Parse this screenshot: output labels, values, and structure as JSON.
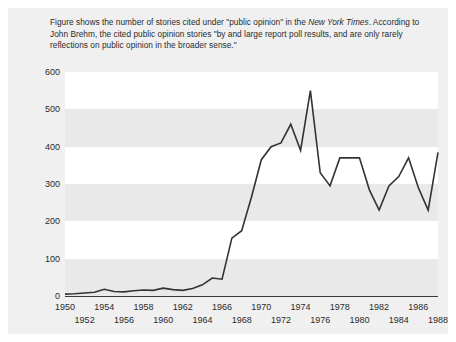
{
  "caption": {
    "line1_a": "Figure shows the number of stories cited under \"public opinion\" in the ",
    "line1_em": "New York Times",
    "line1_b": ".",
    "line2": "According to John Brehm, the cited public opinion stories \"by and large report poll results,",
    "line3": "and are only rarely reflections on public opinion in the broader sense.\""
  },
  "colors": {
    "panel_bg": "#f0f0f0",
    "band_white": "#ffffff",
    "band_gray": "#e9e9e9",
    "line": "#333333",
    "text": "#2b2b2b",
    "axis": "#3a3a3a"
  },
  "chart_data": {
    "type": "line",
    "title": "",
    "xlabel": "",
    "ylabel": "",
    "xlim": [
      1950,
      1988
    ],
    "ylim": [
      0,
      600
    ],
    "yticks": [
      0,
      100,
      200,
      300,
      400,
      500,
      600
    ],
    "ytick_labels": [
      "0",
      "100",
      "200",
      "300",
      "400",
      "500",
      "600"
    ],
    "xticks": [
      1950,
      1952,
      1954,
      1956,
      1958,
      1960,
      1962,
      1964,
      1966,
      1968,
      1970,
      1972,
      1974,
      1976,
      1978,
      1980,
      1982,
      1984,
      1986,
      1988
    ],
    "xtick_labels_row0": [
      "1950",
      "1954",
      "1958",
      "1962",
      "1966",
      "1970",
      "1974",
      "1978",
      "1982",
      "1986"
    ],
    "xtick_labels_row1": [
      "1952",
      "1956",
      "1960",
      "1964",
      "1968",
      "1972",
      "1976",
      "1980",
      "1984",
      "1988"
    ],
    "grid": false,
    "banded_background": true,
    "legend": null,
    "x": [
      1950,
      1951,
      1952,
      1953,
      1954,
      1955,
      1956,
      1957,
      1958,
      1959,
      1960,
      1961,
      1962,
      1963,
      1964,
      1965,
      1966,
      1967,
      1968,
      1969,
      1970,
      1971,
      1972,
      1973,
      1974,
      1975,
      1976,
      1977,
      1978,
      1979,
      1980,
      1981,
      1982,
      1983,
      1984,
      1985,
      1986,
      1987,
      1988
    ],
    "values": [
      5,
      6,
      8,
      10,
      18,
      12,
      11,
      14,
      16,
      15,
      21,
      17,
      15,
      20,
      30,
      48,
      45,
      155,
      175,
      265,
      365,
      400,
      410,
      460,
      390,
      550,
      330,
      295,
      370,
      370,
      370,
      285,
      230,
      295,
      320,
      370,
      290,
      230,
      385
    ],
    "series": [
      {
        "name": "Stories citing \"public opinion\" in the New York Times",
        "values": [
          5,
          6,
          8,
          10,
          18,
          12,
          11,
          14,
          16,
          15,
          21,
          17,
          15,
          20,
          30,
          48,
          45,
          155,
          175,
          265,
          365,
          400,
          410,
          460,
          390,
          550,
          330,
          295,
          370,
          370,
          370,
          285,
          230,
          295,
          320,
          370,
          290,
          230,
          385
        ]
      }
    ]
  }
}
